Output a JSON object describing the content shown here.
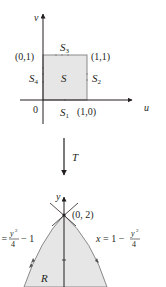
{
  "top_diagram": {
    "axis_u_label": "u",
    "axis_v_label": "v",
    "origin_label": "0",
    "region_label": "S",
    "corner_labels": {
      "top_left": "(0,1)",
      "top_right": "(1,1)",
      "bottom_right": "(1,0)"
    },
    "side_labels": {
      "s1": "S",
      "s1_sub": "1",
      "s2": "S",
      "s2_sub": "2",
      "s3": "S",
      "s3_sub": "3",
      "s4": "S",
      "s4_sub": "4"
    }
  },
  "transform": {
    "label": "T"
  },
  "bottom_diagram": {
    "axis_y_label": "y",
    "vertex_label": "(0, 2)",
    "region_label": "R",
    "left_curve": {
      "prefix": "x = ",
      "num": "y",
      "num_sup": "2",
      "den": "4",
      "suffix": "− 1"
    },
    "right_curve": {
      "prefix": "x = 1 − ",
      "num": "y",
      "num_sup": "2",
      "den": "4"
    }
  },
  "colors": {
    "fill": "#e6e6e6",
    "stroke": "#231f20",
    "edge": "#8a8a8a"
  }
}
